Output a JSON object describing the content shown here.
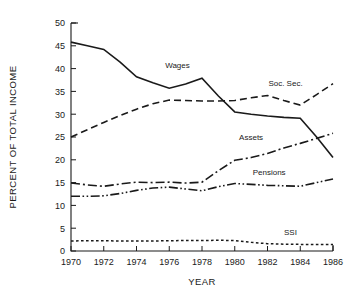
{
  "chart_data": {
    "type": "line",
    "title": "",
    "xlabel": "YEAR",
    "ylabel": "PERCENT OF TOTAL INCOME",
    "x": [
      1970,
      1971,
      1972,
      1973,
      1974,
      1975,
      1976,
      1977,
      1978,
      1979,
      1980,
      1981,
      1982,
      1983,
      1984,
      1985,
      1986
    ],
    "xlim": [
      1970,
      1986
    ],
    "ylim": [
      0,
      50
    ],
    "xticks": [
      1970,
      1972,
      1974,
      1976,
      1978,
      1980,
      1982,
      1984,
      1986
    ],
    "xtick_labels": [
      "1970",
      "1972",
      "1974",
      "1976",
      "1978",
      "1980",
      "1982",
      "1984",
      "1986"
    ],
    "yticks": [
      0,
      5,
      10,
      15,
      20,
      25,
      30,
      35,
      40,
      45,
      50
    ],
    "ytick_labels": [
      "0",
      "5",
      "10",
      "15",
      "20",
      "25",
      "30",
      "35",
      "40",
      "45",
      "50"
    ],
    "grid": false,
    "legend": "inline-labels",
    "series": [
      {
        "name": "Wages",
        "label": "Wages",
        "linestyle": "solid",
        "dasharray": "none",
        "width": 1.6,
        "color": "#1a1a1a",
        "label_x": 1976.5,
        "label_y": 40.2,
        "values": [
          45.8,
          45.0,
          44.2,
          41.4,
          38.2,
          36.9,
          35.7,
          36.6,
          37.9,
          34.0,
          30.5,
          30.0,
          29.6,
          29.3,
          29.1,
          25.0,
          20.5
        ]
      },
      {
        "name": "Soc. Sec.",
        "label": "Soc. Sec.",
        "linestyle": "dashed",
        "dasharray": "7,4",
        "width": 1.6,
        "color": "#1a1a1a",
        "label_x": 1983.1,
        "label_y": 36.1,
        "values": [
          25.0,
          26.6,
          28.2,
          29.7,
          31.1,
          32.3,
          33.1,
          33.0,
          32.9,
          32.9,
          33.0,
          33.6,
          34.1,
          33.0,
          32.0,
          34.3,
          36.7
        ]
      },
      {
        "name": "Assets",
        "label": "Assets",
        "linestyle": "dashdot",
        "dasharray": "9,3,2,3",
        "width": 1.6,
        "color": "#1a1a1a",
        "label_x": 1981.0,
        "label_y": 24.3,
        "values": [
          14.9,
          14.5,
          14.2,
          14.7,
          15.1,
          15.0,
          15.1,
          14.9,
          15.1,
          17.6,
          19.9,
          20.5,
          21.4,
          22.6,
          23.6,
          24.7,
          25.8
        ]
      },
      {
        "name": "Pensions",
        "label": "Pensions",
        "linestyle": "dashdotdot",
        "dasharray": "9,2.5,1.6,2.5,1.6,2.5",
        "width": 1.6,
        "color": "#1a1a1a",
        "label_x": 1982.1,
        "label_y": 16.6,
        "values": [
          12.0,
          12.0,
          12.1,
          12.6,
          13.3,
          13.8,
          14.0,
          13.6,
          13.2,
          14.1,
          14.8,
          14.6,
          14.4,
          14.3,
          14.2,
          15.0,
          15.8
        ]
      },
      {
        "name": "SSI",
        "label": "SSI",
        "linestyle": "dotted",
        "dasharray": "2.6,2.4",
        "width": 1.5,
        "color": "#1a1a1a",
        "label_x": 1983.4,
        "label_y": 3.6,
        "values": [
          2.2,
          2.25,
          2.25,
          2.2,
          2.2,
          2.2,
          2.25,
          2.3,
          2.3,
          2.35,
          2.3,
          1.9,
          1.6,
          1.5,
          1.45,
          1.4,
          1.4
        ]
      }
    ]
  }
}
